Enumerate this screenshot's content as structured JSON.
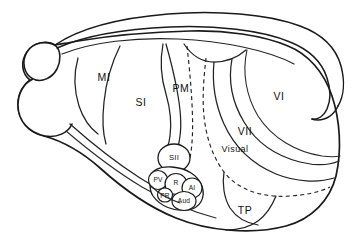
{
  "figure": {
    "background_color": "#ffffff",
    "line_color": "#1a1a1a",
    "text_color": "#111111"
  },
  "areas": [
    {
      "id": "mi",
      "label": "MI",
      "x": 104,
      "y": 78,
      "size": "big"
    },
    {
      "id": "si",
      "label": "SI",
      "x": 141,
      "y": 103,
      "size": "big"
    },
    {
      "id": "pm",
      "label": "PM",
      "x": 181,
      "y": 89,
      "size": "big"
    },
    {
      "id": "vi",
      "label": "VI",
      "x": 279,
      "y": 97,
      "size": "big"
    },
    {
      "id": "vii",
      "label": "VII",
      "x": 245,
      "y": 132,
      "size": "big"
    },
    {
      "id": "visual",
      "label": "Visual",
      "x": 235,
      "y": 150,
      "size": "mixed"
    },
    {
      "id": "sii",
      "label": "SII",
      "x": 174,
      "y": 158,
      "size": "small"
    },
    {
      "id": "pv",
      "label": "PV",
      "x": 158,
      "y": 180,
      "size": "tiny"
    },
    {
      "id": "r",
      "label": "R",
      "x": 175,
      "y": 183,
      "size": "tiny"
    },
    {
      "id": "ai",
      "label": "AI",
      "x": 191,
      "y": 188,
      "size": "tiny"
    },
    {
      "id": "pr",
      "label": "PR",
      "x": 165,
      "y": 196,
      "size": "tiny"
    },
    {
      "id": "aud",
      "label": "Aud",
      "x": 183,
      "y": 201,
      "size": "tiny"
    },
    {
      "id": "tp",
      "label": "TP",
      "x": 245,
      "y": 211,
      "size": "big"
    }
  ],
  "legend_note": ""
}
